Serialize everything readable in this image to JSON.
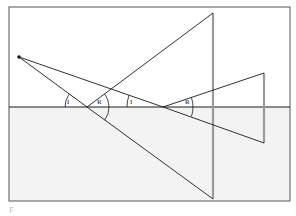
{
  "diagram": {
    "colors": {
      "background": "#ffffff",
      "lower_region": "#f3f3f3",
      "frame": "#555555",
      "rays": "#1a1a1a",
      "objects": "#9a9a9a"
    },
    "frame": {
      "x1": 9,
      "y1": 7,
      "x2": 290,
      "y2": 201
    },
    "horizon_y": 107,
    "source_point": {
      "x": 19,
      "y": 57
    },
    "reflection_points": [
      {
        "x": 87,
        "y": 107
      },
      {
        "x": 163,
        "y": 107
      }
    ],
    "objects": [
      {
        "name": "large-object",
        "x": 213,
        "top": 13,
        "bottom": 199
      },
      {
        "name": "small-object",
        "x": 264,
        "top": 73,
        "bottom": 143
      }
    ],
    "rays": [
      {
        "name": "incident-ray-1",
        "from": [
          19,
          57
        ],
        "to": [
          87,
          107
        ]
      },
      {
        "name": "reflected-ray-1",
        "from": [
          87,
          107
        ],
        "to": [
          213,
          13
        ]
      },
      {
        "name": "transmitted-ray-1",
        "from": [
          87,
          107
        ],
        "to": [
          213,
          199
        ]
      },
      {
        "name": "incident-ray-2",
        "from": [
          19,
          57
        ],
        "to": [
          163,
          107
        ]
      },
      {
        "name": "reflected-ray-2",
        "from": [
          163,
          107
        ],
        "to": [
          264,
          73
        ]
      },
      {
        "name": "transmitted-ray-2",
        "from": [
          163,
          107
        ],
        "to": [
          264,
          143
        ]
      }
    ],
    "angle_labels": [
      {
        "text": "I",
        "x": 68,
        "y": 104
      },
      {
        "text": "R",
        "x": 99,
        "y": 104
      },
      {
        "text": "I",
        "x": 130,
        "y": 104
      },
      {
        "text": "R",
        "x": 187,
        "y": 104
      }
    ]
  },
  "caption": "F                                                 "
}
